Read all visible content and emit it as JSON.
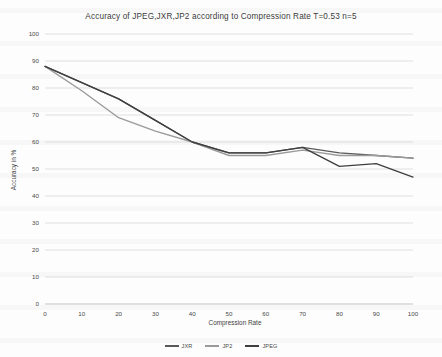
{
  "chart_data": {
    "type": "line",
    "title": "Accuracy of JPEG,JXR,JP2 according to Compression Rate T=0.53 n=5",
    "xlabel": "Compression Rate",
    "ylabel": "Accuracy in %",
    "xlim": [
      0,
      100
    ],
    "ylim": [
      0,
      100
    ],
    "xticks": [
      0,
      10,
      20,
      30,
      40,
      50,
      60,
      70,
      80,
      90,
      100
    ],
    "yticks": [
      0,
      10,
      20,
      30,
      40,
      50,
      60,
      70,
      80,
      90,
      100
    ],
    "grid": "horizontal",
    "legend_position": "bottom",
    "x": [
      0,
      10,
      20,
      30,
      40,
      50,
      60,
      70,
      80,
      90,
      100
    ],
    "series": [
      {
        "name": "JXR",
        "color": "#595959",
        "values": [
          88,
          82,
          76,
          68,
          60,
          56,
          56,
          58,
          56,
          55,
          54
        ]
      },
      {
        "name": "JP2",
        "color": "#9a9a9a",
        "values": [
          88,
          79,
          69,
          64,
          60,
          55,
          55,
          57,
          55,
          55,
          54
        ]
      },
      {
        "name": "JPEG",
        "color": "#3f3f3f",
        "values": [
          88,
          82,
          76,
          68,
          60,
          56,
          56,
          58,
          51,
          52,
          47
        ]
      }
    ]
  },
  "legend": {
    "items": [
      {
        "label": "JXR",
        "color": "#595959"
      },
      {
        "label": "JP2",
        "color": "#9a9a9a"
      },
      {
        "label": "JPEG",
        "color": "#3f3f3f"
      }
    ]
  },
  "axes": {
    "y_title": "Accuracy in %",
    "x_title": "Compression Rate"
  }
}
